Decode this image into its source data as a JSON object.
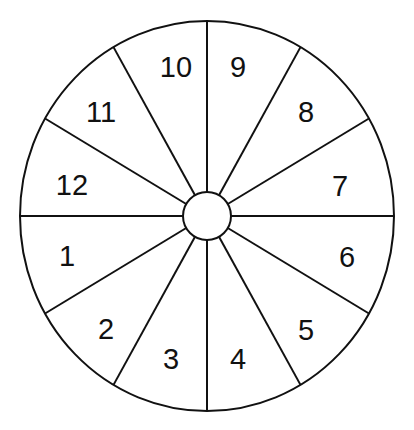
{
  "diagram": {
    "type": "spinner-wheel",
    "center": {
      "x": 207,
      "y": 216
    },
    "outer_radius": {
      "rx": 187,
      "ry": 195
    },
    "hub_radius": 24,
    "stroke_color": "#111111",
    "fill_color": "#ffffff",
    "sector_count": 12,
    "sectors": [
      {
        "label": "1",
        "x": 67,
        "y": 256
      },
      {
        "label": "2",
        "x": 106,
        "y": 329
      },
      {
        "label": "3",
        "x": 171,
        "y": 359
      },
      {
        "label": "4",
        "x": 238,
        "y": 359
      },
      {
        "label": "5",
        "x": 306,
        "y": 330
      },
      {
        "label": "6",
        "x": 347,
        "y": 257
      },
      {
        "label": "7",
        "x": 340,
        "y": 186
      },
      {
        "label": "8",
        "x": 306,
        "y": 112
      },
      {
        "label": "9",
        "x": 238,
        "y": 67
      },
      {
        "label": "10",
        "x": 176,
        "y": 67
      },
      {
        "label": "11",
        "x": 101,
        "y": 112
      },
      {
        "label": "12",
        "x": 72,
        "y": 185
      }
    ]
  }
}
